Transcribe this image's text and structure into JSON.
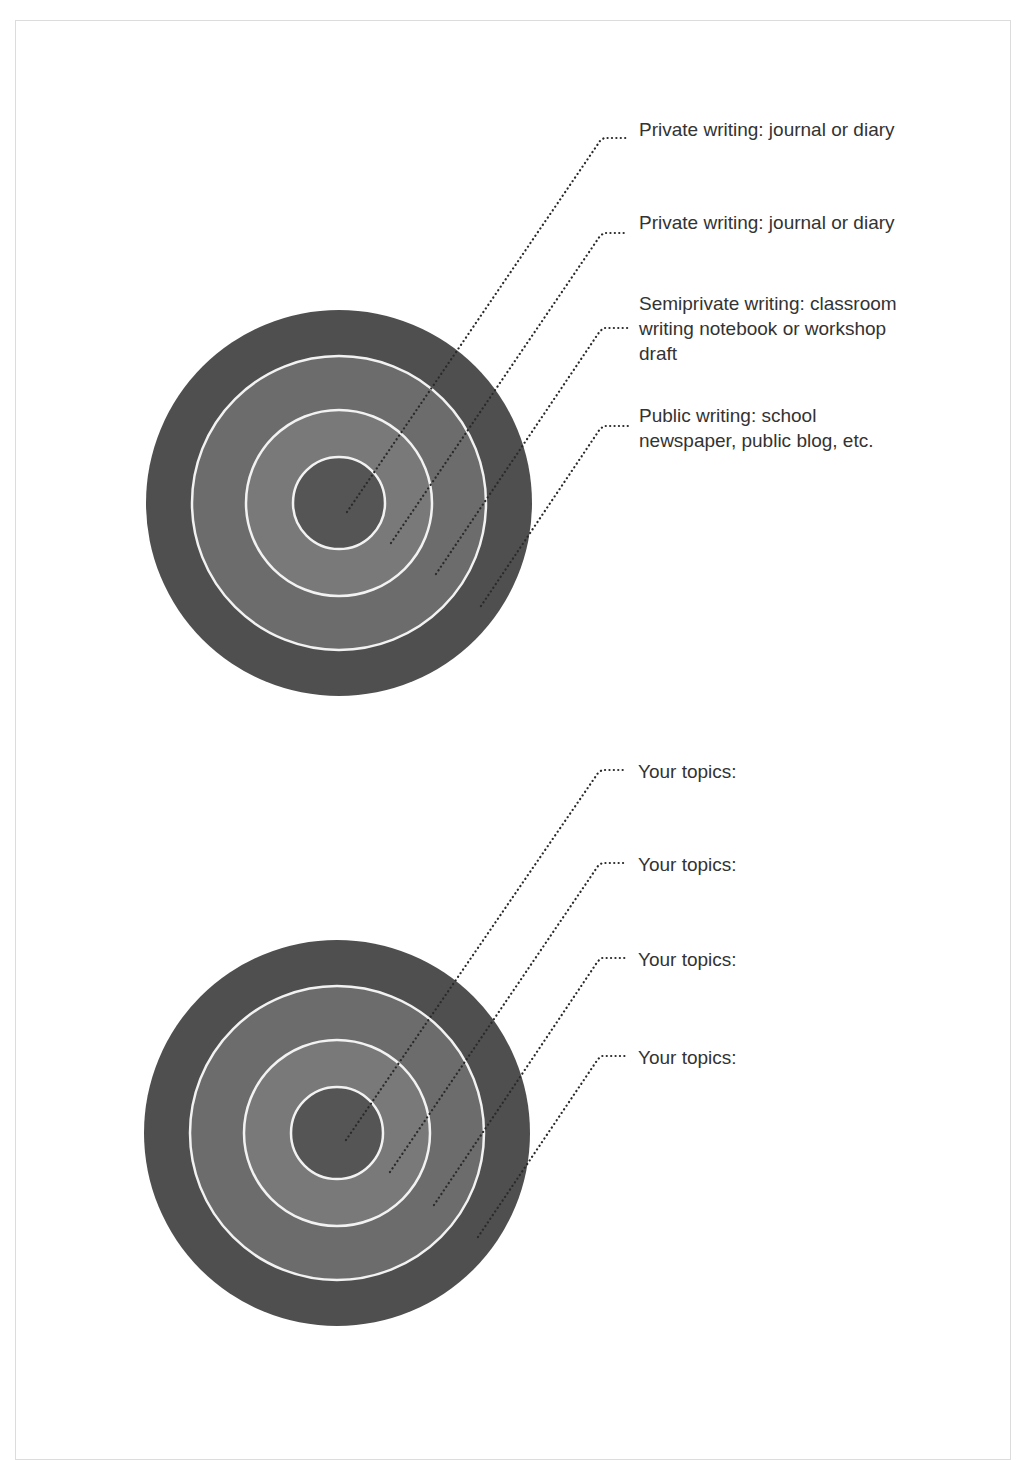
{
  "colors": {
    "outer_ring": "#4f4f4f",
    "second_ring": "#6c6c6c",
    "third_ring": "#797979",
    "center": "#555555",
    "ring_separator": "#f2f2f2",
    "leader_line": "#2a2a2a",
    "text": "#333333"
  },
  "top_target": {
    "labels": [
      {
        "text": "Private writing: journal or diary"
      },
      {
        "text": "Private writing: journal or diary"
      },
      {
        "text": "Semiprivate writing: classroom writing notebook or workshop draft"
      },
      {
        "text": "Public writing: school newspaper, public blog, etc."
      }
    ]
  },
  "bottom_target": {
    "labels": [
      {
        "text": "Your topics:"
      },
      {
        "text": "Your topics:"
      },
      {
        "text": "Your topics:"
      },
      {
        "text": "Your topics:"
      }
    ]
  }
}
